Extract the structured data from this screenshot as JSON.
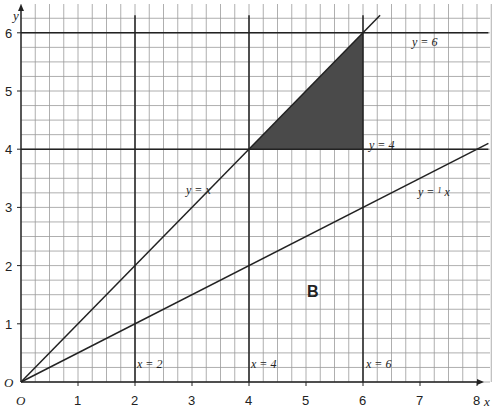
{
  "axes": {
    "x_label": "x",
    "y_label": "y",
    "origin_label": "O",
    "x_ticks": [
      "1",
      "2",
      "3",
      "4",
      "5",
      "6",
      "7",
      "8"
    ],
    "y_ticks": [
      "1",
      "2",
      "3",
      "4",
      "5",
      "6"
    ]
  },
  "lines": {
    "y_eq_6": "y = 6",
    "y_eq_4": "y = 4",
    "y_eq_x": "y = x",
    "y_eq_half_x_prefix": "y = ",
    "y_eq_half_x_frac_num": "1",
    "y_eq_half_x_frac_den": "2",
    "y_eq_half_x_suffix": " x",
    "x_eq_2": "x = 2",
    "x_eq_4": "x = 4",
    "x_eq_6": "x = 6"
  },
  "region_label": "B",
  "colors": {
    "grid": "#9a9a9a",
    "line": "#222222",
    "shaded": "#4a4a4a"
  },
  "chart_data": {
    "type": "line",
    "title": "",
    "xlabel": "x",
    "ylabel": "y",
    "xlim": [
      0,
      8
    ],
    "ylim": [
      0,
      6
    ],
    "grid": true,
    "grid_minor_step": 0.25,
    "series": [
      {
        "name": "y = x",
        "x": [
          0,
          6.3
        ],
        "y": [
          0,
          6.3
        ]
      },
      {
        "name": "y = 1/2 x",
        "x": [
          0,
          8.2
        ],
        "y": [
          0,
          4.1
        ]
      },
      {
        "name": "y = 6",
        "x": [
          0,
          8.2
        ],
        "y": [
          6,
          6
        ]
      },
      {
        "name": "y = 4",
        "x": [
          0,
          8.2
        ],
        "y": [
          4,
          4
        ]
      },
      {
        "name": "x = 2",
        "x": [
          2,
          2
        ],
        "y": [
          0,
          6.3
        ]
      },
      {
        "name": "x = 4",
        "x": [
          4,
          4
        ],
        "y": [
          0,
          6.3
        ]
      },
      {
        "name": "x = 6",
        "x": [
          6,
          6
        ],
        "y": [
          0,
          6.3
        ]
      }
    ],
    "shaded_region": {
      "vertices": [
        [
          4,
          4
        ],
        [
          6,
          4
        ],
        [
          6,
          6
        ]
      ],
      "description": "triangle bounded by y = x, y = 4 and x = 6"
    },
    "annotations": [
      {
        "text": "B",
        "x": 5.3,
        "y": 1.5
      }
    ]
  }
}
